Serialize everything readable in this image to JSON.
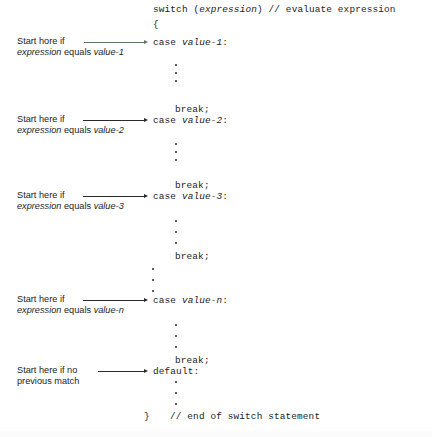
{
  "figure": {
    "kind": "switch-statement-flow-diagram",
    "background_color": "#ffffff",
    "text_color": "#1b1b1b",
    "leader_color": "#2a2a2a",
    "first_leader_tint": "#5d7a5a"
  },
  "code": {
    "header": "switch (expression) // evaluate expression",
    "header_keyword": "switch (",
    "header_italic": "expression",
    "header_tail": ") // evaluate expression",
    "open_brace": "{",
    "close_brace": "}",
    "end_comment": "// end of switch statement",
    "break_label": "break;",
    "cases": [
      {
        "keyword": "case ",
        "value": "value-1",
        "colon": ":"
      },
      {
        "keyword": "case ",
        "value": "value-2",
        "colon": ":"
      },
      {
        "keyword": "case ",
        "value": "value-3",
        "colon": ":"
      },
      {
        "keyword": "case ",
        "value": "value-n",
        "colon": ":"
      },
      {
        "keyword": "default",
        "value": "",
        "colon": ":"
      }
    ]
  },
  "annotations": [
    {
      "line1_a": "Start hore if",
      "line2_a": "expression",
      "line2_b": " equals ",
      "line2_c": "value-1"
    },
    {
      "line1_a": "Start here if",
      "line2_a": "expression",
      "line2_b": " equals ",
      "line2_c": "value-2"
    },
    {
      "line1_a": "Start here if",
      "line2_a": "expression",
      "line2_b": " equals ",
      "line2_c": "value-3"
    },
    {
      "line1_a": "Start here if",
      "line2_a": "expression",
      "line2_b": " equals ",
      "line2_c": "value-n"
    },
    {
      "line1_a": "Start here if no",
      "line2_a": "previous match",
      "line2_b": "",
      "line2_c": ""
    }
  ]
}
